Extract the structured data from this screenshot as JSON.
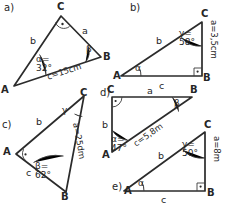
{
  "document": {
    "title": "Trigonometry right-triangle exercise sheet",
    "width": 226,
    "height": 205,
    "ink_color": "#2b2b2b",
    "background_color": "#ffffff"
  },
  "panels": [
    {
      "id": "a",
      "label": "a)",
      "vertices": [
        "C",
        "B",
        "A"
      ],
      "vertex_A": "A",
      "vertex_B": "B",
      "vertex_C": "C",
      "sides": {
        "a": "a",
        "b": "b",
        "c": "c=15cm"
      },
      "angles": {
        "alpha_name": "α=",
        "alpha_value": "32°",
        "beta_name": "β",
        "right_angle_at": "C"
      }
    },
    {
      "id": "b",
      "label": "b)",
      "vertex_A": "A",
      "vertex_B": "B",
      "vertex_C": "C",
      "sides": {
        "a": "a=3,5cm",
        "b": "b",
        "c": "c"
      },
      "angles": {
        "alpha_name": "α",
        "gamma_name": "γ=",
        "gamma_value": "58°",
        "right_angle_at": "B"
      }
    },
    {
      "id": "c",
      "label": "c)",
      "vertex_A": "A",
      "vertex_B": "B",
      "vertex_C": "C",
      "sides": {
        "a": "a=25dm",
        "b": "b",
        "c": "c"
      },
      "angles": {
        "beta_name": "β=",
        "beta_value": "62°",
        "gamma_name": "γ",
        "right_angle_at": "A"
      }
    },
    {
      "id": "d",
      "label": "d)",
      "vertex_A": "A",
      "vertex_B": "B",
      "vertex_C": "C",
      "sides": {
        "a": "a",
        "b": "b",
        "c": "c=5,8m"
      },
      "angles": {
        "alpha_name": "α=",
        "alpha_value": "47°",
        "beta_name": "β",
        "right_angle_at": "C"
      }
    },
    {
      "id": "e",
      "label": "e)",
      "vertex_A": "A",
      "vertex_B": "B",
      "vertex_C": "C",
      "sides": {
        "a": "a=8m",
        "b": "b",
        "c": "c"
      },
      "angles": {
        "alpha_name": "α",
        "gamma_name": "γ=",
        "gamma_value": "50°",
        "right_angle_at": "B"
      }
    }
  ]
}
